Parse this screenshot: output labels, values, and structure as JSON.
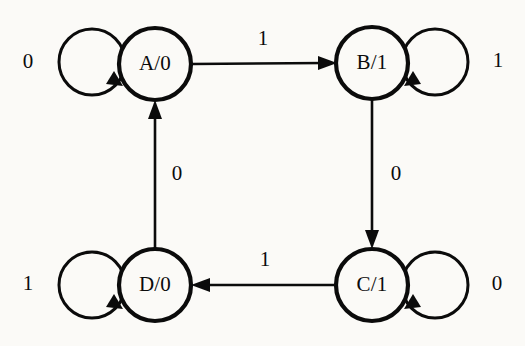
{
  "diagram": {
    "type": "state-transition-diagram",
    "width": 525,
    "height": 346,
    "background_color": "#fbfaf7",
    "stroke_color": "#0b0b0b",
    "node_radius": 36,
    "loop_radius": 33,
    "states": [
      {
        "id": "A",
        "label": "A/0",
        "state_name": "A",
        "output": "0",
        "cx": 155,
        "cy": 64
      },
      {
        "id": "B",
        "label": "B/1",
        "state_name": "B",
        "output": "1",
        "cx": 372,
        "cy": 63
      },
      {
        "id": "C",
        "label": "C/1",
        "state_name": "C",
        "output": "1",
        "cx": 372,
        "cy": 285
      },
      {
        "id": "D",
        "label": "D/0",
        "state_name": "D",
        "output": "0",
        "cx": 155,
        "cy": 285
      }
    ],
    "self_loops": [
      {
        "id": "loop-A",
        "state": "A",
        "input": "0",
        "side": "left",
        "label_x": 28,
        "label_y": 63
      },
      {
        "id": "loop-B",
        "state": "B",
        "input": "1",
        "side": "right",
        "label_x": 498,
        "label_y": 62
      },
      {
        "id": "loop-C",
        "state": "C",
        "input": "0",
        "side": "right",
        "label_x": 497,
        "label_y": 285
      },
      {
        "id": "loop-D",
        "state": "D",
        "input": "1",
        "side": "left",
        "label_x": 28,
        "label_y": 285
      }
    ],
    "transitions": [
      {
        "id": "edge-a-b",
        "from": "A",
        "to": "B",
        "input": "1",
        "direction": "right",
        "label_x": 263,
        "label_y": 40
      },
      {
        "id": "edge-b-c",
        "from": "B",
        "to": "C",
        "input": "0",
        "direction": "down",
        "label_x": 396,
        "label_y": 175
      },
      {
        "id": "edge-c-d",
        "from": "C",
        "to": "D",
        "input": "1",
        "direction": "left",
        "label_x": 265,
        "label_y": 261
      },
      {
        "id": "edge-d-a",
        "from": "D",
        "to": "A",
        "input": "0",
        "direction": "up",
        "label_x": 177,
        "label_y": 175
      }
    ]
  }
}
